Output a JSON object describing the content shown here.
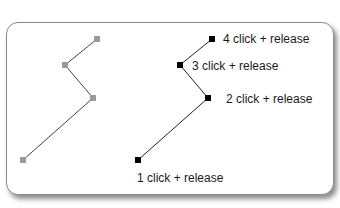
{
  "diagram": {
    "ghost_path": {
      "color": "#9a9a9a",
      "points": [
        [
          23,
          160
        ],
        [
          93,
          98
        ],
        [
          65,
          65
        ],
        [
          97,
          39
        ]
      ]
    },
    "active_path": {
      "color": "#000000",
      "points": [
        {
          "x": 138,
          "y": 160,
          "label": "1  click + release",
          "lx": 137,
          "ly": 182
        },
        {
          "x": 208,
          "y": 98,
          "label": "2  click + release",
          "lx": 226,
          "ly": 103
        },
        {
          "x": 180,
          "y": 65,
          "label": "3  click + release",
          "lx": 192,
          "ly": 70
        },
        {
          "x": 212,
          "y": 39,
          "label": "4  click + release",
          "lx": 223,
          "ly": 43
        }
      ]
    }
  }
}
